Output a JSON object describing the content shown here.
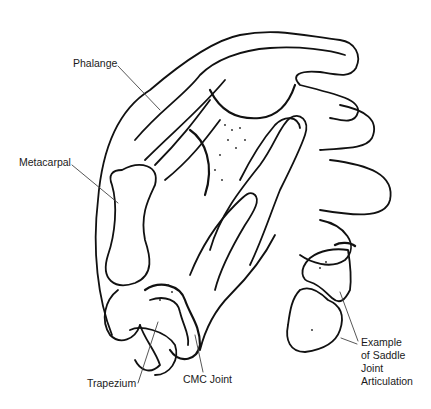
{
  "figure": {
    "labels": {
      "phalange": "Phalange",
      "metacarpal": "Metacarpal",
      "trapezium": "Trapezium",
      "cmc_joint": "CMC Joint",
      "saddle_line1": "Example",
      "saddle_line2": "of Saddle",
      "saddle_line3": "Joint",
      "saddle_line4": "Articulation"
    },
    "colors": {
      "ink": "#111111",
      "background": "#ffffff",
      "label": "#1a1a1a"
    }
  }
}
